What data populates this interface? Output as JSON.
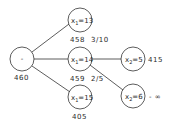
{
  "tree": {
    "root": {
      "label": "-",
      "value": "460"
    },
    "nodes": [
      {
        "id": "n1",
        "var": "x",
        "sub": "1",
        "op": "=",
        "num": "13",
        "value": "458",
        "extra": "3/10"
      },
      {
        "id": "n2",
        "var": "x",
        "sub": "1",
        "op": "=",
        "num": "14",
        "value": "459",
        "extra": "2/5"
      },
      {
        "id": "n3",
        "var": "x",
        "sub": "1",
        "op": "=",
        "num": "15",
        "value": "405",
        "extra": ""
      },
      {
        "id": "n4",
        "var": "x",
        "sub": "2",
        "op": "=",
        "num": "5",
        "value": "415",
        "extra": ""
      },
      {
        "id": "n5",
        "var": "x",
        "sub": "2",
        "op": "=",
        "num": "6",
        "value": "- ∞",
        "extra": ""
      }
    ]
  }
}
